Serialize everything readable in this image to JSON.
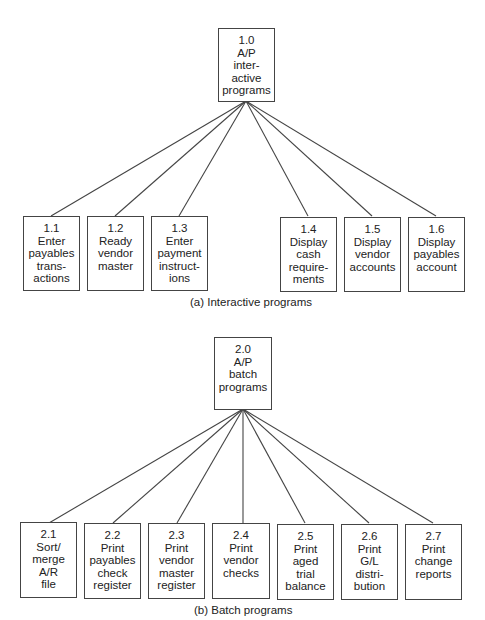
{
  "interactive": {
    "root": {
      "id": "1.0",
      "lines": [
        "1.0",
        "A/P",
        "inter-",
        "active",
        "programs"
      ]
    },
    "children": [
      {
        "id": "1.1",
        "lines": [
          "1.1",
          "Enter",
          "payables",
          "trans-",
          "actions"
        ]
      },
      {
        "id": "1.2",
        "lines": [
          "1.2",
          "Ready",
          "vendor",
          "master"
        ]
      },
      {
        "id": "1.3",
        "lines": [
          "1.3",
          "Enter",
          "payment",
          "instruct-",
          "ions"
        ]
      },
      {
        "id": "1.4",
        "lines": [
          "1.4",
          "Display",
          "cash",
          "require-",
          "ments"
        ]
      },
      {
        "id": "1.5",
        "lines": [
          "1.5",
          "Display",
          "vendor",
          "accounts"
        ]
      },
      {
        "id": "1.6",
        "lines": [
          "1.6",
          "Display",
          "payables",
          "account"
        ]
      }
    ],
    "caption": "(a) Interactive programs"
  },
  "batch": {
    "root": {
      "id": "2.0",
      "lines": [
        "2.0",
        "A/P",
        "batch",
        "programs"
      ]
    },
    "children": [
      {
        "id": "2.1",
        "lines": [
          "2.1",
          "Sort/",
          "merge",
          "A/R",
          "file"
        ]
      },
      {
        "id": "2.2",
        "lines": [
          "2.2",
          "Print",
          "payables",
          "check",
          "register"
        ]
      },
      {
        "id": "2.3",
        "lines": [
          "2.3",
          "Print",
          "vendor",
          "master",
          "register"
        ]
      },
      {
        "id": "2.4",
        "lines": [
          "2.4",
          "Print",
          "vendor",
          "checks"
        ]
      },
      {
        "id": "2.5",
        "lines": [
          "2.5",
          "Print",
          "aged",
          "trial",
          "balance"
        ]
      },
      {
        "id": "2.6",
        "lines": [
          "2.6",
          "Print",
          "G/L",
          "distri-",
          "bution"
        ]
      },
      {
        "id": "2.7",
        "lines": [
          "2.7",
          "Print",
          "change",
          "reports"
        ]
      }
    ],
    "caption": "(b) Batch programs"
  }
}
